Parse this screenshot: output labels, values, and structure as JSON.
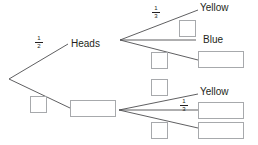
{
  "diagram": {
    "type": "probability-tree",
    "line_color": "#4d4d4f",
    "box_border_color": "#a7a9ac",
    "first_stage": {
      "upper_branch": {
        "label": "Heads",
        "probability": {
          "num": "1",
          "den": "2"
        }
      },
      "lower_branch": {
        "label": "",
        "probability": "",
        "answer_box": "blank"
      }
    },
    "second_stage_heads": {
      "branches": [
        {
          "label": "Yellow",
          "probability": {
            "num": "1",
            "den": "3"
          }
        },
        {
          "label": "Blue",
          "probability": "blank"
        },
        {
          "label": "blank",
          "probability": "blank"
        }
      ]
    },
    "second_stage_tails": {
      "branches": [
        {
          "label": "Yellow",
          "probability": {
            "num": "1",
            "den": "3"
          }
        },
        {
          "label": "blank",
          "probability": "blank"
        },
        {
          "label": "blank",
          "probability": "blank"
        }
      ]
    }
  }
}
